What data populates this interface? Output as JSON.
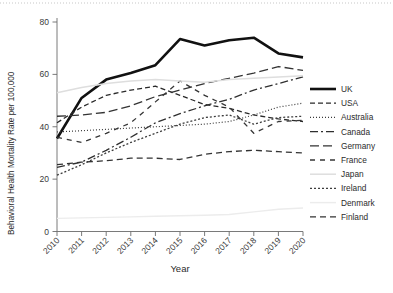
{
  "chart_data": {
    "type": "line",
    "title": "",
    "xlabel": "Year",
    "ylabel": "Behavioral Health Mortality Rate per 100,000",
    "x": [
      2010,
      2011,
      2012,
      2013,
      2014,
      2015,
      2016,
      2017,
      2018,
      2019,
      2020
    ],
    "xticklabels": [
      "2010",
      "2011",
      "2012",
      "2013",
      "2014",
      "2015",
      "2016",
      "2017",
      "2018",
      "2019",
      "2020"
    ],
    "yticklabels": [
      "0",
      "20",
      "40",
      "60",
      "80"
    ],
    "yticks": [
      0,
      20,
      40,
      60,
      80
    ],
    "ylim": [
      0,
      84
    ],
    "xlim": [
      2010,
      2020
    ],
    "grid": false,
    "legend_position": "right",
    "series": [
      {
        "name": "UK",
        "style": "solid-thick",
        "color": "#111111",
        "width": 2.6,
        "dash": "",
        "values": [
          35.5,
          51.0,
          58.0,
          60.5,
          63.5,
          73.5,
          71.0,
          73.0,
          74.0,
          68.0,
          66.5
        ]
      },
      {
        "name": "USA",
        "style": "dashed",
        "color": "#2a2a2a",
        "width": 1.3,
        "dash": "5 3",
        "values": [
          41.5,
          47.5,
          52.0,
          54.0,
          55.5,
          52.0,
          48.5,
          47.0,
          44.5,
          43.0,
          42.0
        ]
      },
      {
        "name": "Australia",
        "style": "dotted",
        "color": "#3a3a3a",
        "width": 1.2,
        "dash": "1 2",
        "values": [
          38.0,
          38.5,
          39.0,
          39.5,
          40.0,
          40.5,
          41.0,
          42.0,
          44.5,
          47.5,
          49.0
        ]
      },
      {
        "name": "Canada",
        "style": "dashdot",
        "color": "#2f2f2f",
        "width": 1.3,
        "dash": "8 3 2 3",
        "values": [
          24.5,
          26.5,
          31.0,
          36.0,
          41.5,
          45.0,
          48.0,
          50.5,
          54.0,
          56.5,
          59.0
        ]
      },
      {
        "name": "Germany",
        "style": "longdash",
        "color": "#333333",
        "width": 1.3,
        "dash": "9 4",
        "values": [
          44.0,
          44.5,
          45.5,
          48.0,
          51.5,
          54.0,
          56.5,
          58.5,
          60.5,
          63.0,
          61.5
        ]
      },
      {
        "name": "France",
        "style": "dash-sparse",
        "color": "#363636",
        "width": 1.3,
        "dash": "5 5",
        "values": [
          36.0,
          34.0,
          37.5,
          41.5,
          49.5,
          57.5,
          52.0,
          47.5,
          37.5,
          42.0,
          42.5
        ]
      },
      {
        "name": "Japan",
        "style": "solid-light",
        "color": "#dedede",
        "width": 1.5,
        "dash": "",
        "values": [
          53.0,
          55.0,
          56.5,
          57.5,
          58.0,
          57.5,
          57.0,
          58.0,
          58.5,
          59.0,
          59.5
        ]
      },
      {
        "name": "Ireland",
        "style": "dotted-dense",
        "color": "#3d3d3d",
        "width": 1.3,
        "dash": "2 2",
        "values": [
          21.5,
          25.5,
          30.0,
          34.0,
          37.5,
          41.0,
          43.5,
          44.5,
          41.0,
          43.5,
          44.0
        ]
      },
      {
        "name": "Denmark",
        "style": "solid-verylight",
        "color": "#ececec",
        "width": 1.4,
        "dash": "",
        "values": [
          5.0,
          5.2,
          5.4,
          5.6,
          5.8,
          6.0,
          6.2,
          6.5,
          7.5,
          8.5,
          9.0
        ]
      },
      {
        "name": "Finland",
        "style": "dashed-med",
        "color": "#333333",
        "width": 1.3,
        "dash": "6 4",
        "values": [
          25.5,
          26.5,
          27.0,
          28.0,
          28.0,
          27.5,
          29.5,
          30.5,
          31.0,
          30.5,
          30.0
        ]
      }
    ]
  },
  "legend": {
    "entries": [
      {
        "label": "UK"
      },
      {
        "label": "USA"
      },
      {
        "label": "Australia"
      },
      {
        "label": "Canada"
      },
      {
        "label": "Germany"
      },
      {
        "label": "France"
      },
      {
        "label": "Japan"
      },
      {
        "label": "Ireland"
      },
      {
        "label": "Denmark"
      },
      {
        "label": "Finland"
      }
    ]
  }
}
